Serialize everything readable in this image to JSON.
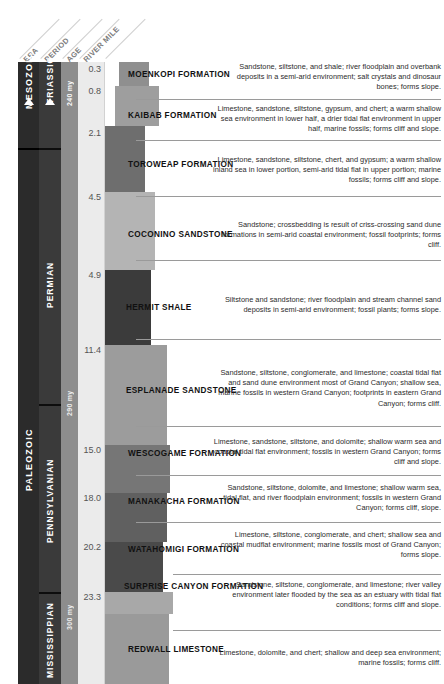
{
  "headers": [
    {
      "label": "ERA"
    },
    {
      "label": "PERIOD"
    },
    {
      "label": "AGE"
    },
    {
      "label": "RIVER MILE"
    }
  ],
  "eras": [
    {
      "label": "MESOZOIC",
      "arrow": true
    },
    {
      "label": "PALEOZOIC",
      "arrow": false
    }
  ],
  "periods": [
    {
      "label": "TRIASSIC",
      "arrow": true
    },
    {
      "label": "PERMIAN",
      "arrow": false
    },
    {
      "label": "PENNSYLVANIAN",
      "arrow": false
    },
    {
      "label": "MISSISSIPPIAN",
      "arrow": false
    }
  ],
  "ages": [
    {
      "label": "240 my"
    },
    {
      "label": "290 my"
    },
    {
      "label": "300 my"
    }
  ],
  "river_miles": [
    "0.3",
    "0.8",
    "2.1",
    "4.5",
    "4.9",
    "11.4",
    "15.0",
    "18.0",
    "20.2",
    "23.3"
  ],
  "group_label": "SUPAI GROUP",
  "formations": [
    {
      "name": "MOENKOPI FORMATION",
      "description": "Sandstone, siltstone, and shale; river floodplain and overbank deposits in a semi-arid environment; salt crystals and dinosaur bones; forms slope."
    },
    {
      "name": "KAIBAB FORMATION",
      "description": "Limestone, sandstone, siltstone, gypsum, and chert; a warm shallow sea environment in lower half, a drier tidal flat environment in upper half, marine fossils; forms cliff and slope."
    },
    {
      "name": "TOROWEAP FORMATION",
      "description": "Limestone, sandstone, siltstone, chert, and gypsum; a warm shallow inland sea in lower portion, semi-arid tidal flat in upper portion; marine fossils; forms cliff and slope."
    },
    {
      "name": "COCONINO SANDSTONE",
      "description": "Sandstone; crossbedding is result of criss-crossing sand dune formations in semi-arid coastal environment; fossil footprints; forms cliff."
    },
    {
      "name": "HERMIT SHALE",
      "description": "Siltstone and sandstone; river floodplain and stream channel sand deposits in semi-arid environment; fossil plants; forms slope."
    },
    {
      "name": "ESPLANADE SANDSTONE",
      "description": "Sandstone, siltstone, conglomerate, and limestone; coastal tidal flat and sand dune environment most of Grand Canyon; shallow sea, marine fossils in western Grand Canyon; footprints in eastern Grand Canyon; forms cliff."
    },
    {
      "name": "WESCOGAME FORMATION",
      "description": "Limestone, sandstone, siltstone, and dolomite; shallow warm sea and coastal tidal flat environment; fossils in western Grand Canyon; forms cliff and slope."
    },
    {
      "name": "MANAKACHA FORMATION",
      "description": "Sandstone, siltstone, dolomite, and limestone; shallow warm sea, tidal flat, and river floodplain environment; fossils in western Grand Canyon; forms cliff, slope."
    },
    {
      "name": "WATAHOMIGI FORMATION",
      "description": "Limestone, siltstone, conglomerate, and chert; shallow sea and coastal mudflat environment; marine fossils most of Grand Canyon; forms slope."
    },
    {
      "name": "SURPRISE CANYON FORMATION",
      "description": "Sandstone, siltstone, conglomerate, and limestone; river valley environment later flooded by the sea as an estuary with tidal flat conditions; forms cliff and slope."
    },
    {
      "name": "REDWALL LIMESTONE",
      "description": "Limestone, dolomite, and chert; shallow and deep sea environment; marine fossils; forms cliff."
    }
  ],
  "colors": {
    "era_band": "#2b2b2b",
    "period_band": "#3a3a3a",
    "age_band": "#8d8d8d",
    "mile_band": "#ebebeb",
    "rule": "#9a9a9a"
  }
}
